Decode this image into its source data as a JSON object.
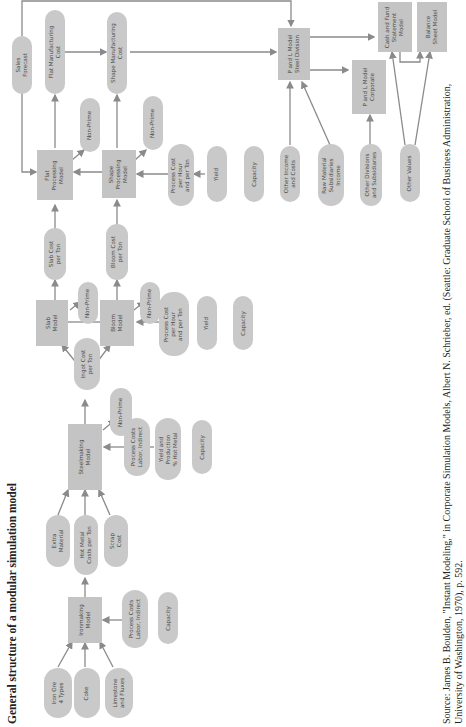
{
  "title": "General structure of a modular simulation model",
  "source": {
    "line1": "Source: James B. Boulden, \"Instant Modeling,\" in Corporate Simulation Models, Albert N. Schrieber, ed. (Seattle: Graduate School of Business Administration,",
    "line2": "University of Washington, 1970), p. 592."
  },
  "nodes": {
    "iron_ore": "Iron Ore\n4 Types",
    "coke": "Coke",
    "limestone": "Limestone\nand Fluxes",
    "ironmaking_model": "Ironmaking\nModel",
    "ironmaking_process_costs": "Process Costs\nLabor, Indirect",
    "ironmaking_capacity": "Capacity",
    "extra_material": "Extra\nMaterial",
    "hot_metal_costs": "Hot Metal\nCosts per Ton",
    "scrap_cost": "Scrap\nCost",
    "steelmaking_model": "Steelmaking\nModel",
    "steelmaking_process_costs": "Process Costs\nLabor, Indirect",
    "steelmaking_yield": "Yield and\nProduction\n% Hot Metal",
    "steelmaking_capacity": "Capacity",
    "steelmaking_nonprime": "Non-Prime",
    "ingot_cost": "Ingot Cost\nper Ton",
    "slab_model": "Slab\nModel",
    "slab_nonprime": "Non-Prime",
    "bloom_model": "Bloom\nModel",
    "bloom_nonprime": "Non-Prime",
    "bloom_process_cost": "Process Cost\nper Hour\nand per Ton",
    "bloom_yield": "Yield",
    "bloom_capacity": "Capacity",
    "slab_cost": "Slab Cost\nper Ton",
    "bloom_cost": "Bloom Cost\nper Ton",
    "flat_processing_model": "Flat\nProcessing\nModel",
    "flat_nonprime": "Non-Prime",
    "shape_processing_model": "Shape\nProcessing\nModel",
    "shape_nonprime": "Non-Prime",
    "shape_process_cost": "Process Cost\nper Hour\nand per Ton",
    "shape_yield": "Yield",
    "shape_capacity": "Capacity",
    "sales_forecast": "Sales\nForecast",
    "flat_mfg_cost": "Flat Manufacturing\nCost",
    "shape_mfg_cost": "Shape Manufacturing\nCost",
    "pl_steel": "P and L Model\nSteel Division",
    "other_income": "Other Income\nand Costs",
    "raw_material_subs": "Raw Material\nSubsidiaries\nIncome",
    "pl_corporate": "P and L Model\nCorporate",
    "other_divisions": "Other Divisions\nand Subsidiaries",
    "other_values": "Other Values",
    "cash_fund": "Cash and Fund\nStatement\nModel",
    "balance_sheet": "Balance\nSheet Model"
  },
  "colors": {
    "node_fill": "#c9c9c9",
    "box_fill": "#c4c4c4",
    "line": "#8a8a8a",
    "text": "#4a4a4a"
  }
}
